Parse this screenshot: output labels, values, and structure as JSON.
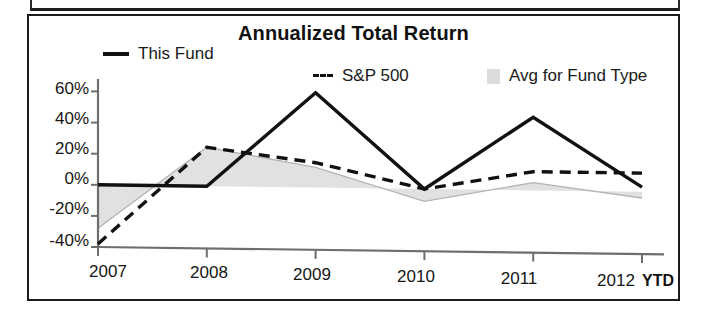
{
  "chart_data": {
    "type": "line",
    "title": "Annualized Total Return",
    "xlabel": "",
    "ylabel": "",
    "x": [
      "2007",
      "2008",
      "2009",
      "2010",
      "2011",
      "2012"
    ],
    "categories": [
      "2007",
      "2008",
      "2009",
      "2010",
      "2011",
      "2012"
    ],
    "x_suffix_label": "YTD",
    "xtick_labels": [
      "2007",
      "2008",
      "2009",
      "2010",
      "2011",
      "2012"
    ],
    "ytick_labels": [
      "60%",
      "40%",
      "20%",
      "0%",
      "-20%",
      "-40%"
    ],
    "ytick_values": [
      60,
      40,
      20,
      0,
      -20,
      -40
    ],
    "ylim": [
      -40,
      68
    ],
    "grid": false,
    "legend_position": "top",
    "series": [
      {
        "name": "This Fund",
        "style": "solid",
        "color": "#111111",
        "values": [
          0,
          0,
          61,
          0,
          47,
          3
        ]
      },
      {
        "name": "S&P 500",
        "style": "dashed",
        "color": "#111111",
        "values": [
          -38,
          25,
          16,
          0,
          12,
          12
        ]
      },
      {
        "name": "Avg for Fund Type",
        "style": "shaded-area",
        "color": "#d6d6d6",
        "values": [
          -28,
          25,
          13,
          -8,
          5,
          -4
        ]
      }
    ]
  },
  "chart": {
    "title": "Annualized Total Return",
    "legend": [
      {
        "label": "This Fund",
        "marker": "solid-line-swatch"
      },
      {
        "label": "S&P 500",
        "marker": "dashed-line-swatch"
      },
      {
        "label": "Avg for Fund Type",
        "marker": "shaded-area-swatch"
      }
    ],
    "y_axis": {
      "ticks": [
        "60%",
        "40%",
        "20%",
        "0%",
        "-20%",
        "-40%"
      ]
    },
    "x_axis": {
      "ticks": [
        "2007",
        "2008",
        "2009",
        "2010",
        "2011",
        "2012"
      ],
      "suffix": "YTD"
    }
  },
  "colors": {
    "line": "#111111",
    "area_fill": "#d6d6d6",
    "frame": "#1c1c1c",
    "background": "#ffffff"
  }
}
